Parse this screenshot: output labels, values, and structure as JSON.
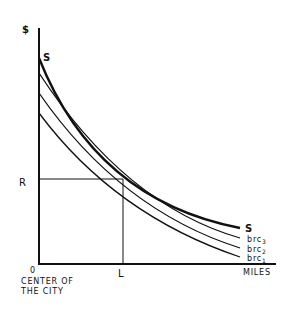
{
  "diagram": {
    "type": "bid-rent / supply curve diagram",
    "y_axis": {
      "label": "$",
      "marked_value": "R"
    },
    "x_axis": {
      "label": "MILES",
      "origin_label": "0",
      "origin_caption_line1": "CENTER OF",
      "origin_caption_line2": "THE CITY",
      "marked_value": "L"
    },
    "curves": [
      {
        "id": "S",
        "label_start": "S",
        "label_end": "S",
        "style": "bold"
      },
      {
        "id": "brc3",
        "label": "brc",
        "subscript": "3"
      },
      {
        "id": "brc2",
        "label": "brc",
        "subscript": "2"
      },
      {
        "id": "brc1",
        "label": "brc",
        "subscript": "1"
      }
    ],
    "colors": {
      "ink": "#111111",
      "background": "#ffffff"
    }
  }
}
